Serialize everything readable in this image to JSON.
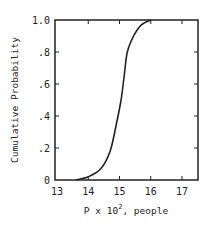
{
  "chart_data": {
    "type": "line",
    "title": "",
    "xlabel": "P x 10^2, people",
    "xlabel_parts": {
      "prefix": "P x 10",
      "sup": "2",
      "suffix": ", people"
    },
    "ylabel": "Cumulative Probability",
    "xlim": [
      13,
      17.5
    ],
    "ylim": [
      0,
      1.0
    ],
    "x_ticks": [
      "13",
      "14",
      "15",
      "16",
      "17"
    ],
    "y_ticks": [
      "0",
      ".2",
      ".4",
      ".6",
      ".8",
      "1.0"
    ],
    "grid": false,
    "legend": null,
    "series": [
      {
        "name": "Cumulative Probability",
        "x": [
          13.6,
          14.0,
          14.4,
          14.7,
          14.9,
          15.05,
          15.15,
          15.25,
          15.45,
          15.7,
          16.0
        ],
        "values": [
          0.0,
          0.02,
          0.07,
          0.18,
          0.35,
          0.5,
          0.65,
          0.8,
          0.9,
          0.97,
          1.0
        ]
      }
    ]
  }
}
